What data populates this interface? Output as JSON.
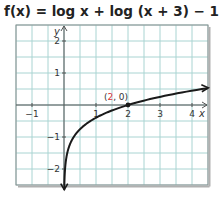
{
  "title": {
    "prefix": "f(x) = log x + log (x + 3) − 1"
  },
  "chart_data": {
    "type": "line",
    "xlabel": "x",
    "ylabel": "y",
    "xlim": [
      -1.5,
      4.5
    ],
    "ylim": [
      -2.5,
      2.5
    ],
    "grid": true,
    "grid_step": 0.5,
    "x_ticks": [
      -1,
      1,
      2,
      3,
      4
    ],
    "y_ticks": [
      2,
      1,
      -1,
      -2
    ],
    "series": [
      {
        "name": "f(x) = log x + log(x + 3) − 1",
        "x": [
          0.005,
          0.01,
          0.05,
          0.1,
          0.2,
          0.4,
          0.7,
          1,
          1.5,
          2,
          2.5,
          3,
          3.5,
          4,
          4.5
        ],
        "values": [
          -2.82,
          -2.52,
          -1.82,
          -1.51,
          -1.19,
          -0.87,
          -0.59,
          -0.4,
          -0.17,
          0.0,
          0.14,
          0.26,
          0.36,
          0.45,
          0.53
        ]
      }
    ],
    "annotations": [
      {
        "label": "(2, 0)",
        "x": 2,
        "y": 0,
        "highlight_color": "#d9343b"
      }
    ],
    "colors": {
      "grid": "#a9d4d2",
      "axis": "#555555",
      "curve": "#1a1a1a",
      "point_label_accent": "#d9343b"
    }
  }
}
